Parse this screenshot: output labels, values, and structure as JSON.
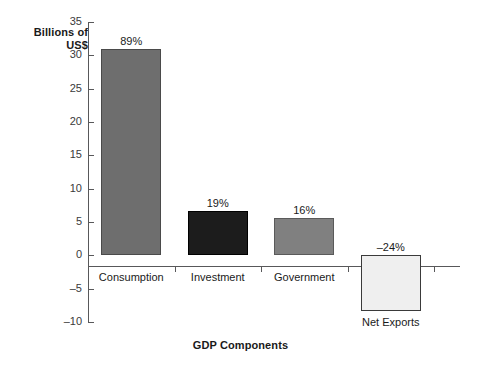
{
  "chart_data": {
    "type": "bar",
    "title": "",
    "xlabel": "GDP Components",
    "ylabel": "Billions of\nUS$",
    "categories": [
      "Consumption",
      "Investment",
      "Government",
      "Net Exports"
    ],
    "values": [
      31.0,
      6.6,
      5.6,
      -8.4
    ],
    "data_labels": [
      "89%",
      "19%",
      "16%",
      "–24%"
    ],
    "bar_colors": [
      "#6e6e6e",
      "#1c1c1c",
      "#808080",
      "#efefef"
    ],
    "bar_border_colors": [
      "#4a4a4a",
      "#000000",
      "#5a5a5a",
      "#3a3a3a"
    ],
    "ylim": [
      -10,
      35
    ],
    "yticks": [
      35,
      30,
      25,
      20,
      15,
      10,
      5,
      0,
      -5,
      -10
    ],
    "ytick_labels": [
      "35",
      "30",
      "25",
      "20",
      "15",
      "10",
      "5",
      "0",
      "–5",
      "–10"
    ],
    "grid": false,
    "legend": "none"
  },
  "axis": {
    "y_title": "Billions of\nUS$",
    "x_title": "GDP Components"
  }
}
